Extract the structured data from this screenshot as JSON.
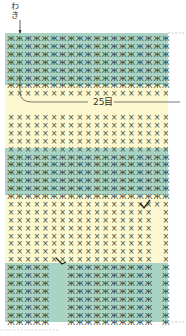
{
  "diagram": {
    "side_label": "わき",
    "stitch_count_label": "25目",
    "columns": 19,
    "stitch_symbols": {
      "single": "×",
      "increase": "ⅹ"
    },
    "colors": {
      "green_band": "#a9d3c2",
      "yellow_band": "#fdf8cf",
      "symbol": "#3a4a44",
      "line": "#333333"
    },
    "bands": [
      {
        "color": "green",
        "top": 33,
        "height": 52
      },
      {
        "color": "yellow",
        "top": 85,
        "height": 63
      },
      {
        "color": "green",
        "top": 148,
        "height": 47
      },
      {
        "color": "yellow",
        "top": 195,
        "height": 68
      },
      {
        "color": "green",
        "top": 263,
        "height": 59
      }
    ],
    "gap_regions": [
      {
        "description": "gap column in lower yellow band (right)",
        "col": 17
      },
      {
        "description": "gap in lower green band",
        "cols": [
          5,
          6
        ]
      }
    ]
  }
}
